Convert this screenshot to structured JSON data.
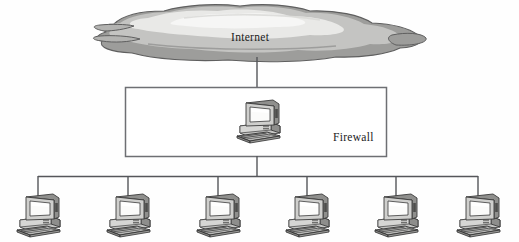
{
  "diagram": {
    "type": "network-topology",
    "title_visible": false,
    "background_color": "#fefefe",
    "line_color": "#55565a",
    "nodes": {
      "cloud": {
        "label": "Internet",
        "icon": "cloud-icon",
        "label_x": 231,
        "label_y": 31,
        "fill_light": "#ececeb",
        "fill_mid": "#c9c9c7",
        "fill_dark": "#9a9a98",
        "outline": "#6b6b6b"
      },
      "firewall": {
        "label": "Firewall",
        "label_x": 333,
        "label_y": 131,
        "box": {
          "x": 125,
          "y": 87,
          "width": 261,
          "height": 70
        },
        "border_color": "#6e6f73",
        "fill": "#ffffff",
        "server": {
          "icon": "computer-icon",
          "x": 235,
          "y": 98
        }
      }
    },
    "bus": {
      "y": 176,
      "x_start": 38,
      "x_end": 478,
      "uplink_x": 257,
      "uplink_from_y": 157,
      "uplink_to_y": 176
    },
    "cloud_link": {
      "x": 257,
      "from_y": 58,
      "to_y": 87
    },
    "workstations": [
      {
        "id": "ws-1",
        "icon": "computer-icon",
        "drop_x": 38,
        "x": 14,
        "y": 188
      },
      {
        "id": "ws-2",
        "icon": "computer-icon",
        "drop_x": 128,
        "x": 104,
        "y": 188
      },
      {
        "id": "ws-3",
        "icon": "computer-icon",
        "drop_x": 218,
        "x": 194,
        "y": 188
      },
      {
        "id": "ws-4",
        "icon": "computer-icon",
        "drop_x": 307,
        "x": 283,
        "y": 188
      },
      {
        "id": "ws-5",
        "icon": "computer-icon",
        "drop_x": 396,
        "x": 372,
        "y": 188
      },
      {
        "id": "ws-6",
        "icon": "computer-icon",
        "drop_x": 478,
        "x": 454,
        "y": 188
      }
    ],
    "workstation_count": 6
  }
}
